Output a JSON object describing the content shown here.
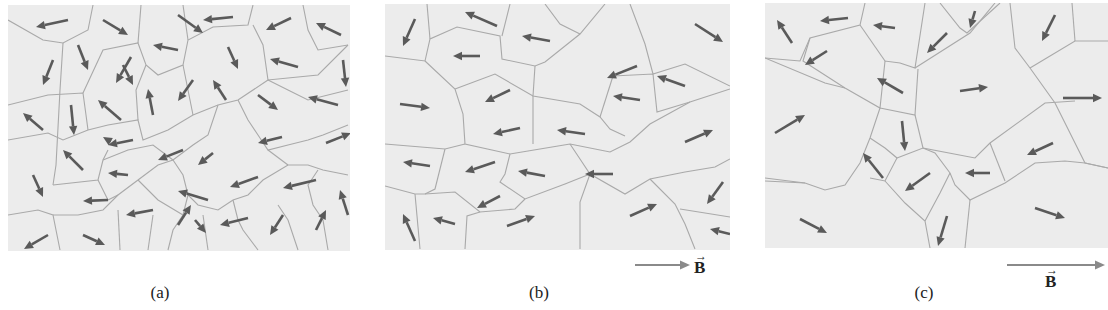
{
  "colors": {
    "panel_bg": "#ececec",
    "boundary": "#a9a9a9",
    "arrow": "#5a5a5a",
    "field_arrow": "#8a8a8a",
    "text": "#222222"
  },
  "panels": [
    {
      "id": "a",
      "caption": "(a)",
      "has_field": false,
      "box": {
        "x": 8,
        "y": 5,
        "w": 342,
        "h": 246
      },
      "boundaries": [
        "0,15 35,35 55,38 80,25 85,0",
        "55,38 52,85 48,160 45,180",
        "0,100 40,90 75,88 78,110 80,125",
        "75,88 95,45 130,38 138,60 150,70 175,60 180,35 205,22 240,20 245,0",
        "130,38 133,0",
        "180,35 175,0",
        "245,20 255,40 260,75 290,72 310,70 340,40",
        "295,0 300,25 310,45 340,40",
        "0,135 40,128 55,135 80,125 100,120 130,115 135,135 160,125 185,110 210,100 230,95 260,75",
        "130,115 128,85 138,60",
        "175,60 185,110",
        "260,75 280,85 300,95 340,85",
        "45,180 90,175 95,155 100,145",
        "0,210 30,205 45,210 48,225 52,245",
        "45,210 70,210 95,205 110,190 130,175 150,160 165,155 185,140 200,130 210,100",
        "95,155 120,145 145,140 165,155",
        "165,155 175,170 180,190 190,200 210,205 225,195 240,190 255,175 280,160 300,160 315,165 340,170",
        "230,95 240,115 250,130 260,145 280,140 300,135 315,130 340,120",
        "260,145 280,160",
        "90,175 100,195 110,190",
        "180,190 175,210 165,225 160,245",
        "130,175 150,195 175,210",
        "225,195 230,215 235,225 250,245",
        "270,200 280,215 290,245",
        "310,165 300,180 305,200 315,215 320,245",
        "110,205 112,245",
        "145,210 140,245",
        "195,210 200,245"
      ],
      "arrows": [
        [
          60,
          15,
          28,
          22
        ],
        [
          95,
          15,
          120,
          30
        ],
        [
          170,
          10,
          195,
          28
        ],
        [
          225,
          12,
          195,
          15
        ],
        [
          283,
          13,
          258,
          25
        ],
        [
          333,
          30,
          308,
          18
        ],
        [
          45,
          55,
          35,
          80
        ],
        [
          70,
          40,
          80,
          65
        ],
        [
          115,
          60,
          125,
          80
        ],
        [
          123,
          52,
          108,
          78
        ],
        [
          170,
          45,
          145,
          40
        ],
        [
          220,
          42,
          230,
          64
        ],
        [
          290,
          62,
          262,
          54
        ],
        [
          335,
          55,
          338,
          82
        ],
        [
          35,
          125,
          15,
          108
        ],
        [
          63,
          100,
          66,
          130
        ],
        [
          113,
          115,
          90,
          95
        ],
        [
          145,
          110,
          140,
          84
        ],
        [
          185,
          75,
          170,
          96
        ],
        [
          218,
          95,
          205,
          75
        ],
        [
          250,
          90,
          270,
          105
        ],
        [
          330,
          100,
          300,
          92
        ],
        [
          100,
          135,
          95,
          132
        ],
        [
          125,
          135,
          100,
          140
        ],
        [
          175,
          145,
          150,
          155
        ],
        [
          205,
          148,
          190,
          160
        ],
        [
          274,
          132,
          250,
          138
        ],
        [
          318,
          138,
          343,
          128
        ],
        [
          75,
          165,
          55,
          145
        ],
        [
          120,
          170,
          100,
          168
        ],
        [
          200,
          195,
          170,
          186
        ],
        [
          250,
          172,
          222,
          182
        ],
        [
          308,
          175,
          275,
          183
        ],
        [
          340,
          210,
          332,
          185
        ],
        [
          25,
          170,
          35,
          192
        ],
        [
          100,
          195,
          75,
          196
        ],
        [
          145,
          205,
          118,
          210
        ],
        [
          170,
          220,
          183,
          200
        ],
        [
          187,
          215,
          198,
          228
        ],
        [
          240,
          213,
          212,
          220
        ],
        [
          275,
          210,
          262,
          230
        ],
        [
          308,
          225,
          318,
          205
        ],
        [
          40,
          230,
          16,
          244
        ],
        [
          75,
          230,
          97,
          240
        ]
      ]
    },
    {
      "id": "b",
      "caption": "(b)",
      "has_field": true,
      "field_label": "B",
      "box": {
        "x": 385,
        "y": 4,
        "w": 345,
        "h": 246
      },
      "boundaries": [
        "0,52 40,57 45,35 72,23 115,32 117,55 150,62 160,58 195,30 220,0",
        "45,35 42,0",
        "117,32 125,0",
        "160,0 175,20 195,30",
        "40,57 70,85 78,110 80,140 125,150 155,145 185,140 225,148 245,138 265,120 305,98 345,85",
        "150,62 148,92 148,140",
        "70,85 110,70 148,92 195,100 215,113 225,125 240,132",
        "245,0 260,40 268,70 300,60 345,82",
        "228,72 215,113",
        "228,72 268,70 272,108 305,98",
        "0,140 60,145 80,140",
        "60,145 50,185 40,190",
        "125,150 120,170 115,178 140,195 180,180 205,170",
        "0,182 30,190 40,190 70,188 95,208 130,205 140,195",
        "185,140 195,155 205,170 240,190 265,175 300,168 330,163 345,155",
        "205,170 195,198 195,245",
        "265,175 290,200 300,220 310,245",
        "295,205 345,213",
        "30,190 35,245",
        "95,208 82,212 80,245"
      ],
      "arrows": [
        [
          30,
          15,
          18,
          42
        ],
        [
          112,
          22,
          80,
          8
        ],
        [
          165,
          37,
          137,
          32
        ],
        [
          95,
          52,
          68,
          52
        ],
        [
          310,
          20,
          338,
          38
        ],
        [
          252,
          62,
          222,
          74
        ],
        [
          300,
          82,
          272,
          72
        ],
        [
          125,
          86,
          100,
          98
        ],
        [
          15,
          100,
          45,
          104
        ],
        [
          255,
          96,
          228,
          92
        ],
        [
          135,
          124,
          108,
          130
        ],
        [
          200,
          130,
          172,
          126
        ],
        [
          300,
          138,
          328,
          126
        ],
        [
          45,
          162,
          18,
          158
        ],
        [
          110,
          158,
          80,
          168
        ],
        [
          160,
          172,
          133,
          167
        ],
        [
          228,
          170,
          200,
          170
        ],
        [
          115,
          192,
          92,
          204
        ],
        [
          70,
          220,
          48,
          214
        ],
        [
          30,
          237,
          18,
          210
        ],
        [
          122,
          222,
          150,
          212
        ],
        [
          245,
          212,
          272,
          200
        ],
        [
          338,
          178,
          322,
          200
        ],
        [
          345,
          230,
          325,
          225
        ]
      ]
    },
    {
      "id": "c",
      "caption": "(c)",
      "has_field": true,
      "field_label": "B",
      "box": {
        "x": 765,
        "y": 3,
        "w": 343,
        "h": 245
      },
      "boundaries": [
        "0,55 35,58 45,35 95,22 100,0",
        "45,35 38,58 80,85 115,105 120,58 135,60 150,65 160,0",
        "95,22 120,58",
        "175,0 195,25 202,30 235,0",
        "150,65 205,30 230,0",
        "0,55 60,80 80,85",
        "115,105 150,112 153,66",
        "115,105 105,135 95,160 80,182 60,187 40,180 0,175",
        "150,112 158,145 210,155 225,140 280,100 310,98",
        "245,0 250,45 265,65 290,100 320,160 343,165",
        "265,65 310,38 343,38",
        "310,38 307,0",
        "105,135 120,145 132,155 120,178 105,175",
        "132,155 158,145 170,150 185,170 190,182 205,197 240,180 270,160 300,158 320,160 343,165",
        "120,178 140,200 160,218 165,245",
        "185,170 175,190 160,218",
        "205,197 200,245",
        "225,140 240,178",
        "0,178 40,180"
      ],
      "arrows": [
        [
          27,
          40,
          12,
          17
        ],
        [
          83,
          15,
          55,
          18
        ],
        [
          130,
          25,
          108,
          22
        ],
        [
          62,
          48,
          40,
          62
        ],
        [
          182,
          30,
          162,
          50
        ],
        [
          210,
          8,
          205,
          25
        ],
        [
          138,
          90,
          112,
          75
        ],
        [
          290,
          12,
          277,
          38
        ],
        [
          195,
          88,
          223,
          84
        ],
        [
          298,
          95,
          337,
          95
        ],
        [
          10,
          130,
          40,
          112
        ],
        [
          137,
          118,
          140,
          148
        ],
        [
          118,
          175,
          98,
          150
        ],
        [
          165,
          170,
          140,
          188
        ],
        [
          225,
          170,
          200,
          170
        ],
        [
          288,
          140,
          262,
          152
        ],
        [
          35,
          216,
          62,
          230
        ],
        [
          182,
          213,
          173,
          243
        ],
        [
          270,
          205,
          300,
          215
        ]
      ]
    }
  ],
  "field_arrows": [
    {
      "panel": "b",
      "x": 635,
      "y": 265,
      "w": 55,
      "label": "B",
      "label_x": 694,
      "label_y": 258
    },
    {
      "panel": "c",
      "x": 1007,
      "y": 265,
      "w": 98,
      "label": "B",
      "label_x": 1045,
      "label_y": 272
    }
  ],
  "captions": [
    {
      "text": "(a)",
      "x": 148,
      "y": 283
    },
    {
      "text": "(b)",
      "x": 527,
      "y": 283
    },
    {
      "text": "(c)",
      "x": 912,
      "y": 283
    }
  ]
}
